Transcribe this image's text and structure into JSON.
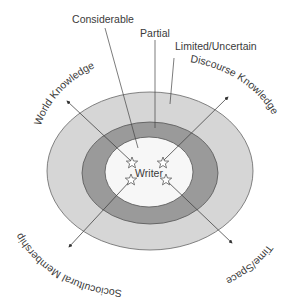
{
  "diagram": {
    "center_label": "Writer",
    "rings": [
      {
        "name": "inner",
        "label": "Considerable",
        "fill": "#f7f7f7"
      },
      {
        "name": "middle",
        "label": "Partial",
        "fill": "#9a9a9a"
      },
      {
        "name": "outer",
        "label": "Limited/Uncertain",
        "fill": "#d6d6d6"
      }
    ],
    "dimensions": [
      {
        "label": "World Knowledge",
        "direction": "upper-left"
      },
      {
        "label": "Discourse Knowledge",
        "direction": "upper-right"
      },
      {
        "label": "Sociocultural Membership",
        "direction": "lower-left"
      },
      {
        "label": "Time/Space",
        "direction": "lower-right"
      }
    ],
    "colors": {
      "outer_ring": "#d6d6d6",
      "middle_ring": "#9a9a9a",
      "inner_ring": "#f7f7f7",
      "stroke": "#555555",
      "text": "#3a3a3a"
    }
  }
}
